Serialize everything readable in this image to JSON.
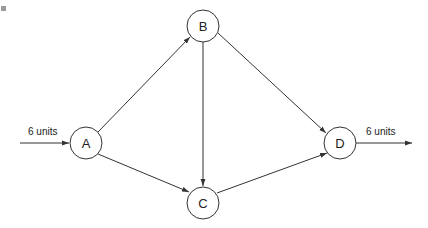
{
  "diagram": {
    "type": "directed-flow-network",
    "nodes": [
      {
        "id": "A",
        "label": "A",
        "cx": 86,
        "cy": 143
      },
      {
        "id": "B",
        "label": "B",
        "cx": 203,
        "cy": 26
      },
      {
        "id": "C",
        "label": "C",
        "cx": 203,
        "cy": 203
      },
      {
        "id": "D",
        "label": "D",
        "cx": 340,
        "cy": 143
      }
    ],
    "edges": [
      {
        "from": "A",
        "to": "B"
      },
      {
        "from": "A",
        "to": "C"
      },
      {
        "from": "B",
        "to": "C"
      },
      {
        "from": "B",
        "to": "D"
      },
      {
        "from": "C",
        "to": "D"
      }
    ],
    "inflow": {
      "to": "A",
      "label": "6  units"
    },
    "outflow": {
      "from": "D",
      "label": "6  units"
    },
    "colors": {
      "stroke": "#333333",
      "background": "#ffffff"
    }
  }
}
